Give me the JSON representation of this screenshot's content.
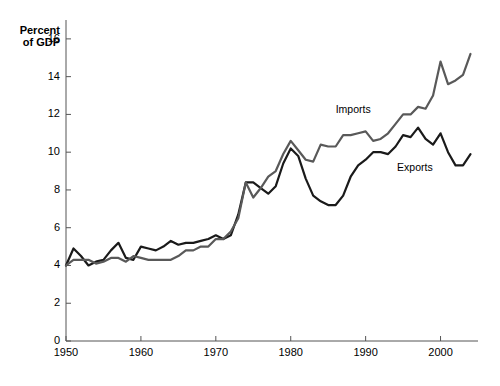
{
  "chart_data": {
    "type": "line",
    "title": "",
    "subtitle": "",
    "ylabel_line1": "Percent",
    "ylabel_line2": "of GDP",
    "xlabel": "",
    "xlim": [
      1950,
      2005
    ],
    "ylim": [
      0,
      17
    ],
    "grid": false,
    "legend_position": "inline-annotation",
    "yticks": [
      0,
      2,
      4,
      6,
      8,
      10,
      12,
      14,
      16
    ],
    "ytick_labels": [
      "0",
      "2",
      "4",
      "6",
      "8",
      "10",
      "12",
      "14",
      "16"
    ],
    "xticks": [
      1950,
      1960,
      1970,
      1980,
      1990,
      2000
    ],
    "xtick_labels": [
      "1950",
      "1960",
      "1970",
      "1980",
      "1990",
      "2000"
    ],
    "x": [
      1950,
      1951,
      1952,
      1953,
      1954,
      1955,
      1956,
      1957,
      1958,
      1959,
      1960,
      1961,
      1962,
      1963,
      1964,
      1965,
      1966,
      1967,
      1968,
      1969,
      1970,
      1971,
      1972,
      1973,
      1974,
      1975,
      1976,
      1977,
      1978,
      1979,
      1980,
      1981,
      1982,
      1983,
      1984,
      1985,
      1986,
      1987,
      1988,
      1989,
      1990,
      1991,
      1992,
      1993,
      1994,
      1995,
      1996,
      1997,
      1998,
      1999,
      2000,
      2001,
      2002,
      2003,
      2004
    ],
    "series": [
      {
        "name": "Exports",
        "color": "#1a1a1a",
        "label_x": 1994.2,
        "label_y": 9.15,
        "values": [
          4.0,
          4.9,
          4.5,
          4.0,
          4.2,
          4.3,
          4.8,
          5.2,
          4.4,
          4.3,
          5.0,
          4.9,
          4.8,
          5.0,
          5.3,
          5.1,
          5.2,
          5.2,
          5.3,
          5.4,
          5.6,
          5.4,
          5.6,
          6.7,
          8.4,
          8.4,
          8.1,
          7.8,
          8.2,
          9.4,
          10.2,
          9.8,
          8.6,
          7.7,
          7.4,
          7.2,
          7.2,
          7.7,
          8.7,
          9.3,
          9.6,
          10.0,
          10.0,
          9.9,
          10.3,
          10.9,
          10.8,
          11.3,
          10.7,
          10.4,
          11.0,
          10.0,
          9.3,
          9.3,
          9.9
        ]
      },
      {
        "name": "Imports",
        "color": "#595959",
        "label_x": 1986.0,
        "label_y": 12.25,
        "values": [
          4.0,
          4.3,
          4.3,
          4.3,
          4.1,
          4.2,
          4.4,
          4.4,
          4.2,
          4.5,
          4.4,
          4.3,
          4.3,
          4.3,
          4.3,
          4.5,
          4.8,
          4.8,
          5.0,
          5.0,
          5.4,
          5.4,
          5.8,
          6.5,
          8.4,
          7.6,
          8.1,
          8.7,
          9.0,
          9.9,
          10.6,
          10.1,
          9.6,
          9.5,
          10.4,
          10.3,
          10.3,
          10.9,
          10.9,
          11.0,
          11.1,
          10.6,
          10.7,
          11.0,
          11.5,
          12.0,
          12.0,
          12.4,
          12.3,
          13.0,
          14.8,
          13.6,
          13.8,
          14.1,
          15.2
        ]
      }
    ],
    "annotations": [
      {
        "text": "Imports",
        "series": "Imports"
      },
      {
        "text": "Exports",
        "series": "Exports"
      }
    ],
    "axis_color": "#555555",
    "text_color": "#000000",
    "background": "#ffffff"
  },
  "geometry": {
    "left": 66,
    "right": 478,
    "top": 20,
    "bottom": 341
  }
}
